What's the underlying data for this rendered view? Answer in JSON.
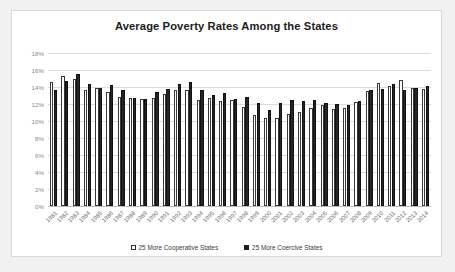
{
  "card": {
    "background_color": "#ffffff",
    "border_color": "#d8d8d8",
    "page_background_color": "#f1f1f1"
  },
  "legend": {
    "position": "bottom-center",
    "items": [
      {
        "label": "25 More Cooperative States",
        "swatch": "white-square-outlined",
        "color": "#ffffff"
      },
      {
        "label": "25 More Coercive States",
        "swatch": "black-square-filled",
        "color": "#1d1d1d"
      }
    ]
  },
  "chart_data": {
    "type": "bar",
    "title": "Average Poverty Rates Among the States",
    "xlabel": "",
    "ylabel": "",
    "ylim": [
      0,
      18
    ],
    "ytick_labels": [
      "0%",
      "2%",
      "4%",
      "6%",
      "8%",
      "10%",
      "12%",
      "14%",
      "16%",
      "18%"
    ],
    "ytick_values": [
      0,
      2,
      4,
      6,
      8,
      10,
      12,
      14,
      16,
      18
    ],
    "grid": true,
    "legend_position": "bottom",
    "categories": [
      "1981",
      "1982",
      "1983",
      "1984",
      "1985",
      "1986",
      "1987",
      "1988",
      "1989",
      "1990",
      "1991",
      "1992",
      "1993",
      "1994",
      "1995",
      "1996",
      "1997",
      "1998",
      "1999",
      "2000",
      "2001",
      "2002",
      "2003",
      "2004",
      "2005",
      "2006",
      "2007",
      "2008",
      "2009",
      "2010",
      "2011",
      "2012",
      "2013",
      "2014"
    ],
    "series": [
      {
        "name": "25 More Cooperative States",
        "color": "#ffffff",
        "values": [
          14.6,
          15.3,
          14.9,
          13.6,
          13.9,
          13.4,
          12.8,
          12.7,
          12.6,
          12.7,
          13.2,
          13.7,
          13.6,
          12.5,
          12.7,
          12.3,
          12.5,
          11.6,
          10.7,
          10.3,
          10.4,
          10.8,
          11.1,
          11.5,
          11.9,
          11.4,
          11.5,
          12.2,
          13.5,
          14.5,
          14.1,
          14.8,
          13.9,
          13.8
        ]
      },
      {
        "name": "25 More Coercive States",
        "color": "#1d1d1d",
        "values": [
          13.6,
          14.7,
          15.5,
          14.4,
          13.9,
          14.2,
          13.6,
          12.7,
          12.6,
          13.4,
          13.8,
          14.4,
          14.6,
          13.7,
          13.1,
          13.3,
          12.6,
          12.8,
          12.1,
          11.3,
          12.1,
          12.5,
          12.4,
          12.5,
          12.1,
          12.0,
          11.9,
          12.4,
          13.7,
          13.8,
          14.3,
          13.6,
          13.9,
          14.1
        ]
      }
    ]
  }
}
